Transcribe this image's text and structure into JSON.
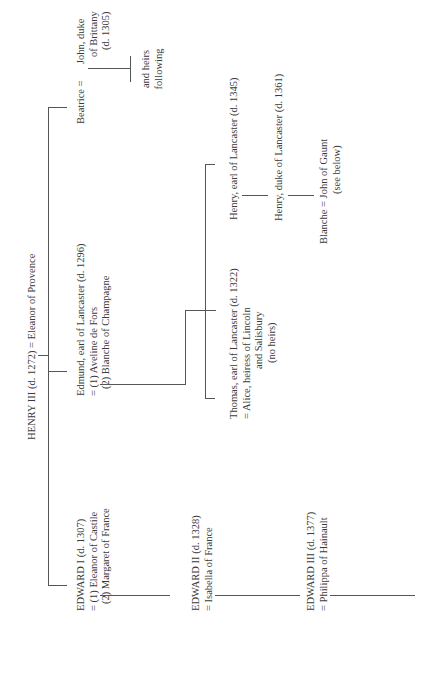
{
  "diagram": {
    "type": "genealogical-tree",
    "orientation": "rotated-90-ccw",
    "root": {
      "name": "HENRY III (d. 1272)",
      "spouse": "= Eleanor of Provence"
    },
    "children": [
      {
        "name": "EDWARD I (d. 1307)",
        "spouses": [
          "= (1) Eleanor of Castile",
          "(2) Margaret of France"
        ]
      },
      {
        "name": "Edmund, earl of Lancaster (d. 1296)",
        "spouses": [
          "= (1) Aveline de Fors",
          "(2) Blanche of Champagne"
        ]
      },
      {
        "name": "Beatrice",
        "spouse_eq": "=",
        "spouse_lines": [
          "John, duke",
          "of Brittany",
          "(d. 1305)"
        ],
        "descendants": [
          "and heirs",
          "following"
        ]
      }
    ],
    "edward2": {
      "name": "EDWARD II (d. 1328)",
      "spouse": "= Isabella of France"
    },
    "edward3": {
      "name": "EDWARD III (d. 1377)",
      "spouse": "= Philippa of Hainault"
    },
    "thomas": {
      "name": "Thomas, earl of Lancaster (d. 1322)",
      "spouse_lines": [
        "= Alice, heiress of Lincoln",
        "and Salisbury",
        "(no heirs)"
      ]
    },
    "henry_earl": {
      "name": "Henry, earl of Lancaster (d. 1345)"
    },
    "henry_duke": {
      "name": "Henry, duke of Lancaster (d. 1361)"
    },
    "blanche": {
      "name": "Blanche = John of Gaunt",
      "note": "(see below)"
    }
  }
}
